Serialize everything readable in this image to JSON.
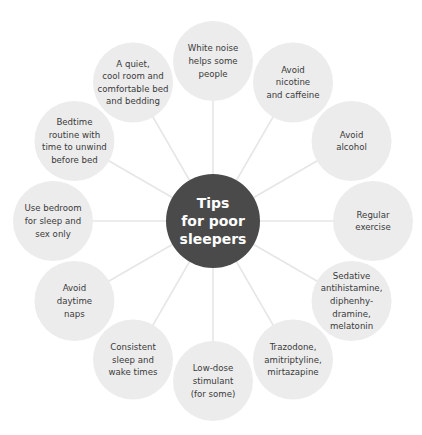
{
  "center": {
    "lines": [
      "Tips",
      "for poor",
      "sleepers"
    ]
  },
  "colors": {
    "center_fill": "#4a4a4a",
    "satellite_fill": "#ececec",
    "connector": "#e6e6e6",
    "text": "#3a3a3a"
  },
  "tips": [
    {
      "id": "white-noise",
      "lines": [
        "White noise",
        "helps some",
        "people"
      ]
    },
    {
      "id": "avoid-nicotine-caffeine",
      "lines": [
        "Avoid",
        "nicotine",
        "and caffeine"
      ]
    },
    {
      "id": "avoid-alcohol",
      "lines": [
        "Avoid",
        "alcohol"
      ]
    },
    {
      "id": "regular-exercise",
      "lines": [
        "Regular",
        "exercise"
      ]
    },
    {
      "id": "sedative-antihistamine",
      "lines": [
        "Sedative",
        "antihistamine,",
        "diphenhy-",
        "dramine,",
        "melatonin"
      ]
    },
    {
      "id": "trazodone",
      "lines": [
        "Trazodone,",
        "amitriptyline,",
        "mirtazapine"
      ]
    },
    {
      "id": "low-dose-stimulant",
      "lines": [
        "Low-dose",
        "stimulant",
        "(for some)"
      ]
    },
    {
      "id": "consistent-sleep-wake",
      "lines": [
        "Consistent",
        "sleep and",
        "wake times"
      ]
    },
    {
      "id": "avoid-daytime-naps",
      "lines": [
        "Avoid",
        "daytime",
        "naps"
      ]
    },
    {
      "id": "bedroom-sleep-sex-only",
      "lines": [
        "Use bedroom",
        "for sleep and",
        "sex only"
      ]
    },
    {
      "id": "bedtime-routine",
      "lines": [
        "Bedtime",
        "routine with",
        "time to unwind",
        "before bed"
      ]
    },
    {
      "id": "quiet-cool-room",
      "lines": [
        "A quiet,",
        "cool room and",
        "comfortable bed",
        "and bedding"
      ]
    }
  ]
}
